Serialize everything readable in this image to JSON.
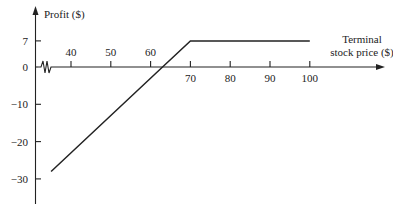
{
  "chart_data": {
    "type": "line",
    "title": "",
    "xlabel": "Terminal stock price ($)",
    "xlabel_lines": [
      "Terminal",
      "stock price ($)"
    ],
    "ylabel": "Profit ($)",
    "x_ticks": [
      40,
      50,
      60,
      70,
      80,
      90,
      100
    ],
    "x_tick_labels": [
      "40",
      "50",
      "60",
      "70",
      "80",
      "90",
      "100"
    ],
    "y_ticks": [
      7,
      0,
      -10,
      -20,
      -30
    ],
    "y_tick_labels": [
      "7",
      "0",
      "−10",
      "−20",
      "−30"
    ],
    "xlim": [
      32,
      118
    ],
    "ylim": [
      -37,
      13
    ],
    "axis_break": "x-axis break near origin (zigzag)",
    "grid": false,
    "legend": null,
    "series": [
      {
        "name": "Profit",
        "x": [
          35,
          63,
          70,
          100
        ],
        "y": [
          -28,
          0,
          7,
          7
        ]
      }
    ],
    "annotations": []
  },
  "colors": {
    "line": "#222222",
    "background": "#ffffff"
  }
}
